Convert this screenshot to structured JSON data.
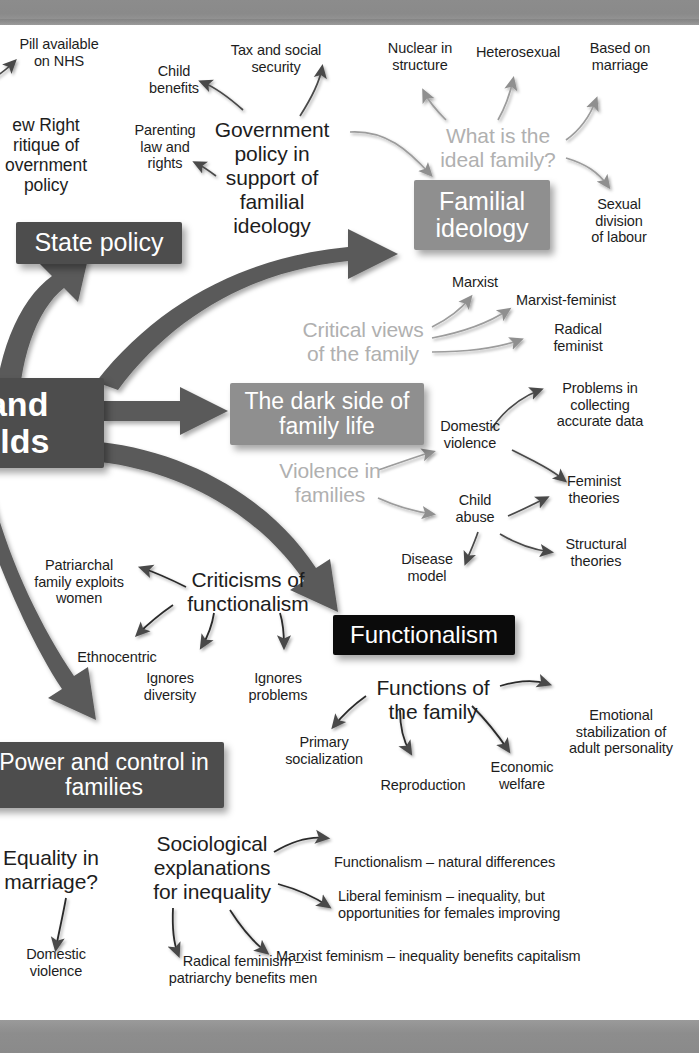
{
  "diagram": {
    "colors": {
      "node_black": "#0b0b0b",
      "node_dark_grey": "#4d4d4d",
      "node_mid_grey": "#8f8f8f",
      "thick_arrow": "#5a5a5a",
      "thin_arrow": "#4a4a4a",
      "faded_label": "#b0b0b0",
      "body_text": "#1d1d1d",
      "page_band": "#8c8c8c",
      "background": "#ffffff"
    },
    "central_node": {
      "label": "s and\nholds"
    },
    "main_nodes": [
      {
        "id": "state-policy",
        "label": "State policy",
        "style": "dark"
      },
      {
        "id": "familial-ideology",
        "label": "Familial\nideology",
        "style": "medium"
      },
      {
        "id": "dark-side",
        "label": "The dark side of\nfamily life",
        "style": "medium"
      },
      {
        "id": "functionalism",
        "label": "Functionalism",
        "style": "black"
      },
      {
        "id": "power-control",
        "label": "Power and\ncontrol in families",
        "style": "dark"
      }
    ],
    "sub_headings": [
      {
        "id": "gov-policy",
        "label": "Government\npolicy in\nsupport of\nfamilial\nideology"
      },
      {
        "id": "ideal-family",
        "label": "What is the\nideal family?",
        "faded": true
      },
      {
        "id": "critical-views",
        "label": "Critical views\nof the family",
        "faded": true
      },
      {
        "id": "violence-in-families",
        "label": "Violence in\nfamilies",
        "faded": true
      },
      {
        "id": "criticisms-functionalism",
        "label": "Criticisms of\nfunctionalism"
      },
      {
        "id": "functions-family",
        "label": "Functions of\nthe family"
      },
      {
        "id": "sociological-explanations",
        "label": "Sociological\nexplanations\nfor inequality"
      },
      {
        "id": "equality-marriage",
        "label": "Equality in\nmarriage?"
      }
    ],
    "leaf_labels": [
      {
        "id": "pill-nhs",
        "label": "Pill available\non NHS"
      },
      {
        "id": "new-right",
        "label": "ew Right\nritique of\novernment\npolicy"
      },
      {
        "id": "child-benefits",
        "label": "Child\nbenefits"
      },
      {
        "id": "tax-social-security",
        "label": "Tax and social\nsecurity"
      },
      {
        "id": "parenting-law",
        "label": "Parenting\nlaw and\nrights"
      },
      {
        "id": "nuclear-structure",
        "label": "Nuclear in\nstructure"
      },
      {
        "id": "heterosexual",
        "label": "Heterosexual"
      },
      {
        "id": "based-on-marriage",
        "label": "Based on\nmarriage"
      },
      {
        "id": "sexual-division-labour",
        "label": "Sexual\ndivision\nof labour"
      },
      {
        "id": "marxist",
        "label": "Marxist"
      },
      {
        "id": "marxist-feminist",
        "label": "Marxist-feminist"
      },
      {
        "id": "radical-feminist",
        "label": "Radical\nfeminist"
      },
      {
        "id": "domestic-violence-1",
        "label": "Domestic\nviolence"
      },
      {
        "id": "problems-data",
        "label": "Problems in\ncollecting\naccurate data"
      },
      {
        "id": "feminist-theories",
        "label": "Feminist\ntheories"
      },
      {
        "id": "child-abuse",
        "label": "Child\nabuse"
      },
      {
        "id": "structural-theories",
        "label": "Structural\ntheories"
      },
      {
        "id": "disease-model",
        "label": "Disease\nmodel"
      },
      {
        "id": "patriarchal-exploits",
        "label": "Patriarchal\nfamily exploits\nwomen"
      },
      {
        "id": "ethnocentric",
        "label": "Ethnocentric"
      },
      {
        "id": "ignores-diversity",
        "label": "Ignores\ndiversity"
      },
      {
        "id": "ignores-problems",
        "label": "Ignores\nproblems"
      },
      {
        "id": "primary-socialization",
        "label": "Primary\nsocialization"
      },
      {
        "id": "reproduction",
        "label": "Reproduction"
      },
      {
        "id": "economic-welfare",
        "label": "Economic\nwelfare"
      },
      {
        "id": "emotional-stabilization",
        "label": "Emotional\nstabilization of\nadult personality"
      },
      {
        "id": "functionalism-natural",
        "label": "Functionalism – natural differences"
      },
      {
        "id": "liberal-feminism",
        "label": "Liberal feminism – inequality, but\nopportunities for females improving"
      },
      {
        "id": "marxist-feminism-capitalism",
        "label": "Marxist feminism – inequality benefits capitalism"
      },
      {
        "id": "radical-feminism-patriarchy",
        "label": "Radical feminism –\npatriarchy benefits men"
      },
      {
        "id": "domestic-violence-2",
        "label": "Domestic\nviolence"
      }
    ]
  }
}
